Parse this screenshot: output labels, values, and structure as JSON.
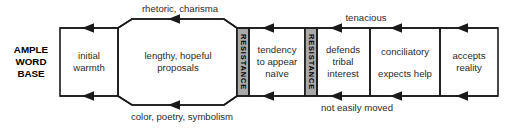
{
  "diagram": {
    "colors": {
      "stroke": "#1a1a1a",
      "text": "#2b2b2b",
      "resistance_fill": "#a9a9a9",
      "background": "#ffffff"
    },
    "base_label": {
      "line1": "AMPLE",
      "line2": "WORD",
      "line3": "BASE"
    },
    "stages": [
      {
        "id": "initial-warmth",
        "shape": "rect",
        "lines": [
          "initial",
          "warmth"
        ]
      },
      {
        "id": "lengthy-hopeful-proposals",
        "shape": "octagon",
        "lines": [
          "lengthy, hopeful",
          "proposals"
        ]
      },
      {
        "id": "resistance-1",
        "shape": "vertical-band",
        "lines": [
          "RESISTANCE"
        ]
      },
      {
        "id": "tendency-to-appear-naive",
        "shape": "rect",
        "lines": [
          "tendency",
          "to appear",
          "naïve"
        ]
      },
      {
        "id": "resistance-2",
        "shape": "vertical-band",
        "lines": [
          "RESISTANCE"
        ]
      },
      {
        "id": "defends-tribal-interest",
        "shape": "rect",
        "lines": [
          "defends",
          "tribal",
          "interest"
        ]
      },
      {
        "id": "conciliatory-expects-help",
        "shape": "rect",
        "lines": [
          "conciliatory",
          "expects help"
        ]
      },
      {
        "id": "accepts-reality",
        "shape": "rect",
        "lines": [
          "accepts",
          "reality"
        ]
      }
    ],
    "edge_labels": [
      {
        "id": "rhetoric-charisma",
        "text": "rhetoric, charisma",
        "position": "top-left"
      },
      {
        "id": "color-poetry-symbolism",
        "text": "color, poetry, symbolism",
        "position": "bottom-left"
      },
      {
        "id": "tenacious",
        "text": "tenacious",
        "position": "top-right"
      },
      {
        "id": "not-easily-moved",
        "text": "not easily moved",
        "position": "bottom-right"
      }
    ]
  }
}
